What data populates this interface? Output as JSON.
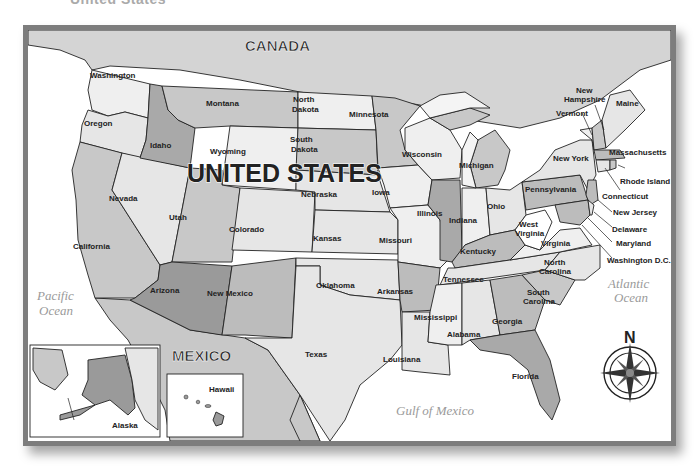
{
  "page": {
    "top_caption": "United States"
  },
  "map": {
    "title": "UNITED STATES",
    "countries": {
      "canada": "CANADA",
      "mexico": "MEXICO"
    },
    "water_bodies": {
      "pacific": [
        "Pacific",
        "Ocean"
      ],
      "atlantic": [
        "Atlantic",
        "Ocean"
      ],
      "gulf": "Gulf of Mexico"
    },
    "compass": {
      "north_label": "N"
    },
    "insets": {
      "alaska": "Alaska",
      "hawaii": "Hawaii"
    },
    "colors": {
      "light": "#e6e6e6",
      "lighter": "#efefef",
      "mid": "#c8c8c8",
      "dark": "#a9a9a9",
      "darker": "#9a9a9a",
      "canada_mexico": "#d4d4d4",
      "water": "#ffffff",
      "border": "#7d7d7d"
    },
    "states": {
      "washington": "Washington",
      "oregon": "Oregon",
      "california": "California",
      "idaho": "Idaho",
      "nevada": "Nevada",
      "montana": "Montana",
      "wyoming": "Wyoming",
      "utah": "Utah",
      "arizona": "Arizona",
      "colorado": "Colorado",
      "new_mexico": "New Mexico",
      "north_dakota": [
        "North",
        "Dakota"
      ],
      "south_dakota": [
        "South",
        "Dakota"
      ],
      "nebraska": "Nebraska",
      "kansas": "Kansas",
      "oklahoma": "Oklahoma",
      "texas": "Texas",
      "minnesota": "Minnesota",
      "iowa": "Iowa",
      "missouri": "Missouri",
      "arkansas": "Arkansas",
      "louisiana": "Louisiana",
      "wisconsin": "Wisconsin",
      "illinois": "Illinois",
      "michigan": "Michigan",
      "indiana": "Indiana",
      "ohio": "Ohio",
      "kentucky": "Kentucky",
      "tennessee": "Tennessee",
      "mississippi": "Mississippi",
      "alabama": "Alabama",
      "georgia": "Georgia",
      "florida": "Florida",
      "south_carolina": [
        "South",
        "Carolina"
      ],
      "north_carolina": [
        "North",
        "Carolina"
      ],
      "virginia": "Virginia",
      "west_virginia": [
        "West",
        "Virginia"
      ],
      "pennsylvania": "Pennsylvania",
      "new_york": "New York",
      "vermont": "Vermont",
      "new_hampshire": [
        "New",
        "Hampshire"
      ],
      "maine": "Maine",
      "massachusetts": "Massachusetts",
      "rhode_island": "Rhode Island",
      "connecticut": "Connecticut",
      "new_jersey": "New Jersey",
      "delaware": "Delaware",
      "maryland": "Maryland",
      "dc": "Washington D.C."
    }
  }
}
